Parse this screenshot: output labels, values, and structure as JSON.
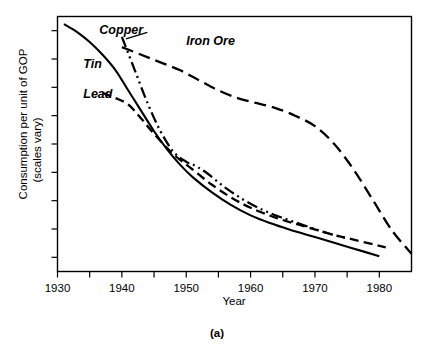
{
  "figure": {
    "caption": "(a)",
    "background_color": "#ffffff",
    "ink_color": "#000000"
  },
  "chart_data": {
    "type": "line",
    "title": "",
    "subtitle": "",
    "xlabel": "Year",
    "ylabel": "Consumption per unit of GOP",
    "ylabel_line2": "(scales vary)",
    "xlim": [
      1930,
      1985
    ],
    "ylim": [
      0,
      100
    ],
    "grid": false,
    "legend_position": "inline-annotations",
    "x_ticks_major": [
      1930,
      1940,
      1950,
      1960,
      1970,
      1980
    ],
    "x_tick_labels": [
      "1930",
      "1940",
      "1950",
      "1960",
      "1970",
      "1980"
    ],
    "x_ticks_minor": [
      1935,
      1945,
      1955,
      1965,
      1975
    ],
    "y_ticks_count": 9,
    "y_tick_labels": [],
    "annotations": [
      {
        "text": "Copper",
        "x": 1936.5,
        "y": 93,
        "series": "Copper",
        "has_leader": true
      },
      {
        "text": "Tin",
        "x": 1934.0,
        "y": 80,
        "series": "Tin",
        "has_leader": false
      },
      {
        "text": "Lead",
        "x": 1934.0,
        "y": 68,
        "series": "Lead",
        "has_leader": false
      },
      {
        "text": "Iron Ore",
        "x": 1950.0,
        "y": 89,
        "series": "Iron Ore",
        "has_leader": false
      }
    ],
    "series": [
      {
        "name": "Tin",
        "style": "solid",
        "dash": "none",
        "x": [
          1931,
          1933,
          1935,
          1937,
          1939,
          1941,
          1943,
          1945,
          1947,
          1949,
          1951,
          1954,
          1957,
          1960,
          1963,
          1966,
          1970,
          1974,
          1978,
          1980
        ],
        "values": [
          97,
          94,
          90,
          85,
          79,
          71,
          63,
          55,
          48,
          42,
          37,
          31,
          26,
          22,
          19,
          16.5,
          13.5,
          10.5,
          7.5,
          6
        ]
      },
      {
        "name": "Lead",
        "style": "dashed",
        "dash": "9 5",
        "x": [
          1937,
          1939,
          1941,
          1943,
          1945,
          1948,
          1951,
          1954,
          1957,
          1960,
          1964,
          1968,
          1972,
          1976,
          1981
        ],
        "values": [
          70,
          68,
          65.5,
          60,
          54,
          46,
          40,
          34,
          29,
          25,
          21,
          18,
          15,
          12.5,
          9.5
        ]
      },
      {
        "name": "Copper",
        "style": "dash-dot-dot",
        "dash": "11 4 2 4 2 4",
        "x": [
          1940,
          1942,
          1944,
          1946,
          1948,
          1950,
          1951,
          1953,
          1956,
          1959,
          1962,
          1965,
          1969,
          1972,
          1975
        ],
        "values": [
          92,
          79,
          66,
          55,
          47,
          43,
          42,
          39,
          33,
          28,
          24,
          21,
          17.5,
          15,
          13
        ]
      },
      {
        "name": "Iron Ore",
        "style": "long-dashed",
        "dash": "12 6",
        "x": [
          1940,
          1943,
          1946,
          1949,
          1952,
          1955,
          1958,
          1961,
          1964,
          1967,
          1970,
          1973,
          1976,
          1979,
          1982,
          1985
        ],
        "values": [
          88,
          85,
          82,
          79,
          75,
          71,
          68,
          66,
          64,
          61,
          57,
          50,
          40,
          28,
          16,
          7
        ]
      }
    ]
  }
}
